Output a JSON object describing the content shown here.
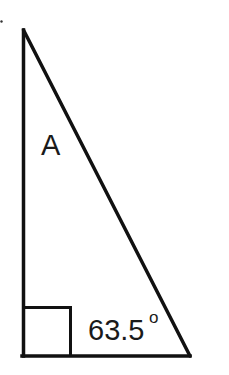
{
  "diagram": {
    "type": "right-triangle",
    "vertices": {
      "top": [
        23,
        30
      ],
      "right_angle": [
        23,
        356
      ],
      "bottom_right": [
        190,
        356
      ]
    },
    "labels": {
      "angle_a": "A",
      "angle_b_value": "63.5",
      "degree_symbol": "o"
    },
    "right_angle_marker": {
      "size": 47
    },
    "colors": {
      "stroke": "#111111",
      "background": "#ffffff"
    }
  }
}
